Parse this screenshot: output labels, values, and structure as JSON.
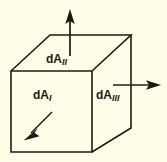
{
  "figure": {
    "background_color": "#fdfde8",
    "ink_color": "#1c1c14",
    "shape": {
      "name": "cube",
      "type": "wireframe-box",
      "faces_labeled": 3
    },
    "labels": [
      {
        "id": "dA1",
        "base": "dA",
        "subscript": "I",
        "face": "front",
        "arrow_direction": "down-left"
      },
      {
        "id": "dA2",
        "base": "dA",
        "subscript": "II",
        "face": "top",
        "arrow_direction": "up"
      },
      {
        "id": "dA3",
        "base": "dA",
        "subscript": "III",
        "face": "right",
        "arrow_direction": "right"
      }
    ],
    "arrows": [
      {
        "id": "arrow-dA1",
        "direction": "down-left",
        "from": [
          52,
          113
        ],
        "to": [
          24,
          140
        ]
      },
      {
        "id": "arrow-dA2",
        "direction": "up",
        "from": [
          70,
          56
        ],
        "to": [
          70,
          11
        ]
      },
      {
        "id": "arrow-dA3",
        "direction": "right",
        "from": [
          113,
          85
        ],
        "to": [
          161,
          85
        ]
      }
    ],
    "cube_geometry": {
      "front_face": [
        [
          11,
          71
        ],
        [
          92,
          71
        ],
        [
          92,
          152
        ],
        [
          11,
          152
        ]
      ],
      "top_face": [
        [
          11,
          71
        ],
        [
          50,
          35
        ],
        [
          131,
          35
        ],
        [
          92,
          71
        ]
      ],
      "right_face": [
        [
          92,
          71
        ],
        [
          131,
          35
        ],
        [
          131,
          128
        ],
        [
          92,
          152
        ]
      ]
    }
  }
}
